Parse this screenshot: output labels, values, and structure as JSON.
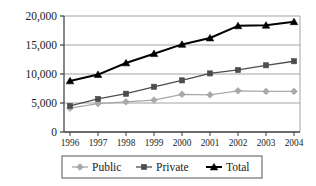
{
  "chart_data": {
    "type": "line",
    "title": "",
    "subtitle": "",
    "xlabel": "",
    "ylabel": "",
    "categories": [
      "1996",
      "1997",
      "1998",
      "1999",
      "2000",
      "2001",
      "2002",
      "2003",
      "2004"
    ],
    "x": [
      1996,
      1997,
      1998,
      1999,
      2000,
      2001,
      2002,
      2003,
      2004
    ],
    "series": [
      {
        "name": "Public",
        "marker": "diamond",
        "color": "#a8a8a8",
        "values": [
          4100,
          4900,
          5200,
          5500,
          6500,
          6400,
          7100,
          7000,
          7000
        ]
      },
      {
        "name": "Private",
        "marker": "square",
        "color": "#4d4d4d",
        "values": [
          4500,
          5700,
          6600,
          7800,
          8900,
          10100,
          10700,
          11500,
          12200
        ]
      },
      {
        "name": "Total",
        "marker": "triangle",
        "color": "#000000",
        "values": [
          8800,
          9900,
          11900,
          13500,
          15100,
          16200,
          18300,
          18400,
          19000
        ]
      }
    ],
    "ylim": [
      0,
      20000
    ],
    "yticks": [
      0,
      5000,
      10000,
      15000,
      20000
    ],
    "ytick_labels": [
      "0",
      "5,000",
      "10,000",
      "15,000",
      "20,000"
    ],
    "grid": true,
    "grid_axis": "y",
    "grid_color": "#999999",
    "legend_position": "bottom",
    "legend_entries": [
      "Public",
      "Private",
      "Total"
    ],
    "axis_color": "#4a4a4a",
    "background_color": "#ffffff"
  }
}
